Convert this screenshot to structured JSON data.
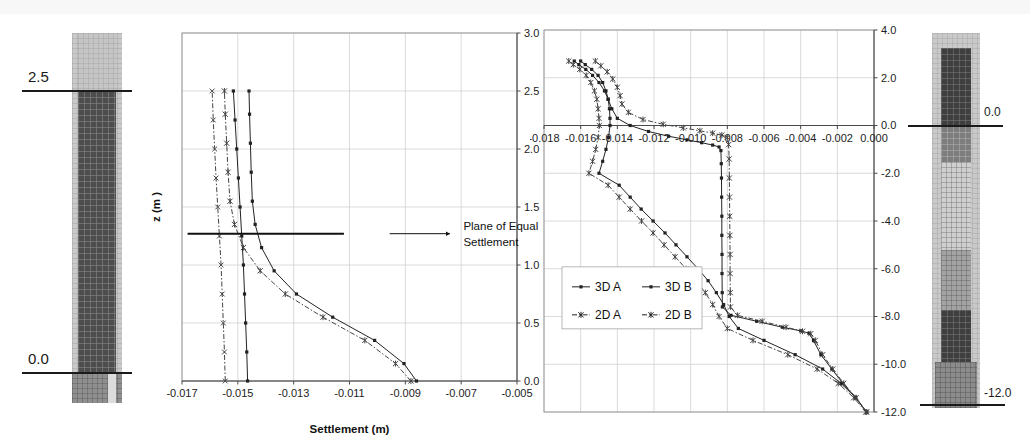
{
  "figure": {
    "background": "#ffffff",
    "width": 1030,
    "height": 443
  },
  "left_column_diagram": {
    "name": "soil-column-left",
    "top_label": "2.5",
    "bottom_label": "0.0",
    "outer_color": "#c9c9c9",
    "upper_fill_color": "#c2c2c2",
    "pile_color": "#4a4a4a",
    "base_color": "#8c8c8c"
  },
  "right_column_diagram": {
    "name": "soil-column-right",
    "top_label": "0.0",
    "bottom_label": "-12.0",
    "outer_color": "#c9c9c9",
    "pile_color": "#3f3f3f",
    "soil_color": "#9c9c9c",
    "light_band_color": "#cfcfcf"
  },
  "annotation": {
    "line1": "Plane of Equal",
    "line2": "Settlement"
  },
  "chart_data": [
    {
      "id": "left-chart",
      "type": "line",
      "title": "",
      "xlabel": "Settlement (m)",
      "ylabel": "z (m )",
      "xlim": [
        -0.017,
        -0.005
      ],
      "ylim": [
        0.0,
        3.0
      ],
      "xticks": [
        -0.017,
        -0.015,
        -0.013,
        -0.011,
        -0.009,
        -0.007,
        -0.005
      ],
      "xtick_labels": [
        "-0.017",
        "-0.015",
        "-0.013",
        "-0.011",
        "-0.009",
        "-0.007",
        "-0.005"
      ],
      "yticks": [
        0.0,
        0.5,
        1.0,
        1.5,
        2.0,
        2.5,
        3.0
      ],
      "ytick_labels": [
        "0.0",
        "0.5",
        "1.0",
        "1.5",
        "2.0",
        "2.5",
        "3.0"
      ],
      "grid": true,
      "legend": "none",
      "y_axis_side": "right",
      "annotation": {
        "text_line1": "Plane of Equal",
        "text_line2": "Settlement",
        "arrow_y": 1.27,
        "arrow_x_start": -0.0168,
        "arrow_x_end": -0.0112
      },
      "series": [
        {
          "name": "3D A",
          "marker": "dot",
          "dash": "solid",
          "color": "#222222",
          "points": [
            {
              "x": -0.01465,
              "y": 0.0
            },
            {
              "x": -0.01468,
              "y": 0.25
            },
            {
              "x": -0.01472,
              "y": 0.5
            },
            {
              "x": -0.01476,
              "y": 0.75
            },
            {
              "x": -0.0148,
              "y": 1.0
            },
            {
              "x": -0.01486,
              "y": 1.25
            },
            {
              "x": -0.01492,
              "y": 1.5
            },
            {
              "x": -0.01498,
              "y": 1.75
            },
            {
              "x": -0.01504,
              "y": 2.0
            },
            {
              "x": -0.0151,
              "y": 2.25
            },
            {
              "x": -0.01516,
              "y": 2.5
            }
          ]
        },
        {
          "name": "3D B",
          "marker": "dot",
          "dash": "solid",
          "color": "#222222",
          "points": [
            {
              "x": -0.0086,
              "y": 0.0
            },
            {
              "x": -0.00905,
              "y": 0.15
            },
            {
              "x": -0.0101,
              "y": 0.35
            },
            {
              "x": -0.0116,
              "y": 0.55
            },
            {
              "x": -0.0129,
              "y": 0.75
            },
            {
              "x": -0.0137,
              "y": 0.95
            },
            {
              "x": -0.01415,
              "y": 1.15
            },
            {
              "x": -0.01438,
              "y": 1.35
            },
            {
              "x": -0.01448,
              "y": 1.55
            },
            {
              "x": -0.01452,
              "y": 1.8
            },
            {
              "x": -0.01455,
              "y": 2.05
            },
            {
              "x": -0.01458,
              "y": 2.3
            },
            {
              "x": -0.0146,
              "y": 2.5
            }
          ]
        },
        {
          "name": "2D A",
          "marker": "cross",
          "dash": "dashdot",
          "color": "#444444",
          "points": [
            {
              "x": -0.01545,
              "y": 0.0
            },
            {
              "x": -0.01548,
              "y": 0.25
            },
            {
              "x": -0.01552,
              "y": 0.5
            },
            {
              "x": -0.01556,
              "y": 0.75
            },
            {
              "x": -0.0156,
              "y": 1.0
            },
            {
              "x": -0.01566,
              "y": 1.25
            },
            {
              "x": -0.01572,
              "y": 1.5
            },
            {
              "x": -0.01578,
              "y": 1.75
            },
            {
              "x": -0.01583,
              "y": 2.0
            },
            {
              "x": -0.01588,
              "y": 2.25
            },
            {
              "x": -0.01592,
              "y": 2.5
            }
          ]
        },
        {
          "name": "2D B",
          "marker": "star",
          "dash": "dashdot",
          "color": "#444444",
          "points": [
            {
              "x": -0.0088,
              "y": 0.0
            },
            {
              "x": -0.00935,
              "y": 0.15
            },
            {
              "x": -0.01045,
              "y": 0.35
            },
            {
              "x": -0.01195,
              "y": 0.55
            },
            {
              "x": -0.0133,
              "y": 0.75
            },
            {
              "x": -0.0142,
              "y": 0.95
            },
            {
              "x": -0.0148,
              "y": 1.15
            },
            {
              "x": -0.01512,
              "y": 1.35
            },
            {
              "x": -0.01528,
              "y": 1.55
            },
            {
              "x": -0.01535,
              "y": 1.8
            },
            {
              "x": -0.0154,
              "y": 2.05
            },
            {
              "x": -0.01545,
              "y": 2.3
            },
            {
              "x": -0.01548,
              "y": 2.5
            }
          ]
        }
      ]
    },
    {
      "id": "right-chart",
      "type": "line",
      "title": "",
      "xlabel": "Settlement (m)",
      "ylabel": "z (m )",
      "xlim": [
        -0.018,
        0.0
      ],
      "ylim": [
        -12.0,
        4.0
      ],
      "xticks": [
        -0.018,
        -0.016,
        -0.014,
        -0.012,
        -0.01,
        -0.008,
        -0.006,
        -0.004,
        -0.002,
        0.0
      ],
      "xtick_labels": [
        "-0.018",
        "-0.016",
        "-0.014",
        "-0.012",
        "-0.010",
        "-0.008",
        "-0.006",
        "-0.004",
        "-0.002",
        "0.000"
      ],
      "yticks": [
        -12.0,
        -10.0,
        -8.0,
        -6.0,
        -4.0,
        -2.0,
        0.0,
        2.0,
        4.0
      ],
      "ytick_labels": [
        "-12.0",
        "-10.0",
        "-8.0",
        "-6.0",
        "-4.0",
        "-2.0",
        "0.0",
        "2.0",
        "4.0"
      ],
      "grid": true,
      "legend": "inside-lower-left",
      "y_axis_side": "right",
      "legend_entries": [
        {
          "label": "3D A",
          "marker": "dot",
          "dash": "solid"
        },
        {
          "label": "3D B",
          "marker": "dot",
          "dash": "solid"
        },
        {
          "label": "2D A",
          "marker": "star",
          "dash": "dashdot"
        },
        {
          "label": "2D B",
          "marker": "star",
          "dash": "dashdot"
        }
      ],
      "series": [
        {
          "name": "3D A",
          "marker": "dot",
          "dash": "solid",
          "color": "#222222",
          "points": [
            {
              "x": -0.016,
              "y": 2.7
            },
            {
              "x": -0.01575,
              "y": 2.55
            },
            {
              "x": -0.0154,
              "y": 2.35
            },
            {
              "x": -0.01505,
              "y": 2.1
            },
            {
              "x": -0.0148,
              "y": 1.8
            },
            {
              "x": -0.01462,
              "y": 1.45
            },
            {
              "x": -0.0145,
              "y": 1.1
            },
            {
              "x": -0.01443,
              "y": 0.7
            },
            {
              "x": -0.0144,
              "y": 0.3
            },
            {
              "x": -0.0144,
              "y": 0.0
            },
            {
              "x": -0.01448,
              "y": -0.5
            },
            {
              "x": -0.01462,
              "y": -1.0
            },
            {
              "x": -0.0148,
              "y": -1.5
            },
            {
              "x": -0.015,
              "y": -2.0
            },
            {
              "x": -0.0139,
              "y": -2.5
            },
            {
              "x": -0.0133,
              "y": -3.0
            },
            {
              "x": -0.0127,
              "y": -3.5
            },
            {
              "x": -0.01205,
              "y": -4.0
            },
            {
              "x": -0.0114,
              "y": -4.5
            },
            {
              "x": -0.0108,
              "y": -5.0
            },
            {
              "x": -0.0102,
              "y": -5.5
            },
            {
              "x": -0.0096,
              "y": -6.0
            },
            {
              "x": -0.00905,
              "y": -6.5
            },
            {
              "x": -0.0086,
              "y": -7.0
            },
            {
              "x": -0.0082,
              "y": -7.5
            },
            {
              "x": -0.0079,
              "y": -8.0
            },
            {
              "x": -0.0074,
              "y": -8.5
            },
            {
              "x": -0.006,
              "y": -9.0
            },
            {
              "x": -0.0043,
              "y": -9.6
            },
            {
              "x": -0.0028,
              "y": -10.2
            },
            {
              "x": -0.0018,
              "y": -10.8
            },
            {
              "x": -0.001,
              "y": -11.4
            },
            {
              "x": -0.0004,
              "y": -12.0
            }
          ]
        },
        {
          "name": "3D B",
          "marker": "dot",
          "dash": "solid",
          "color": "#222222",
          "points": [
            {
              "x": -0.01635,
              "y": 2.7
            },
            {
              "x": -0.0161,
              "y": 2.55
            },
            {
              "x": -0.01572,
              "y": 2.35
            },
            {
              "x": -0.01535,
              "y": 2.1
            },
            {
              "x": -0.015,
              "y": 1.8
            },
            {
              "x": -0.0147,
              "y": 1.45
            },
            {
              "x": -0.0145,
              "y": 1.1
            },
            {
              "x": -0.0143,
              "y": 0.7
            },
            {
              "x": -0.014,
              "y": 0.3
            },
            {
              "x": -0.0133,
              "y": 0.0
            },
            {
              "x": -0.0123,
              "y": -0.25
            },
            {
              "x": -0.0112,
              "y": -0.45
            },
            {
              "x": -0.0102,
              "y": -0.6
            },
            {
              "x": -0.0094,
              "y": -0.72
            },
            {
              "x": -0.0088,
              "y": -0.82
            },
            {
              "x": -0.00845,
              "y": -0.9
            },
            {
              "x": -0.00835,
              "y": -1.05
            },
            {
              "x": -0.00833,
              "y": -1.6
            },
            {
              "x": -0.00832,
              "y": -2.2
            },
            {
              "x": -0.00831,
              "y": -3.0
            },
            {
              "x": -0.0083,
              "y": -3.8
            },
            {
              "x": -0.0083,
              "y": -4.6
            },
            {
              "x": -0.00829,
              "y": -5.4
            },
            {
              "x": -0.00829,
              "y": -6.2
            },
            {
              "x": -0.00828,
              "y": -7.0
            },
            {
              "x": -0.00827,
              "y": -7.6
            },
            {
              "x": -0.0078,
              "y": -7.95
            },
            {
              "x": -0.0064,
              "y": -8.2
            },
            {
              "x": -0.005,
              "y": -8.45
            },
            {
              "x": -0.004,
              "y": -8.6
            },
            {
              "x": -0.00355,
              "y": -8.7
            },
            {
              "x": -0.0033,
              "y": -9.0
            },
            {
              "x": -0.0029,
              "y": -9.6
            },
            {
              "x": -0.0023,
              "y": -10.2
            },
            {
              "x": -0.0017,
              "y": -10.8
            },
            {
              "x": -0.001,
              "y": -11.4
            },
            {
              "x": -0.0004,
              "y": -12.0
            }
          ]
        },
        {
          "name": "2D A",
          "marker": "star",
          "dash": "dashdot",
          "color": "#444444",
          "points": [
            {
              "x": -0.01665,
              "y": 2.7
            },
            {
              "x": -0.0164,
              "y": 2.55
            },
            {
              "x": -0.01605,
              "y": 2.35
            },
            {
              "x": -0.0157,
              "y": 2.1
            },
            {
              "x": -0.01545,
              "y": 1.8
            },
            {
              "x": -0.01525,
              "y": 1.45
            },
            {
              "x": -0.01512,
              "y": 1.1
            },
            {
              "x": -0.01505,
              "y": 0.7
            },
            {
              "x": -0.015,
              "y": 0.3
            },
            {
              "x": -0.01498,
              "y": 0.0
            },
            {
              "x": -0.01505,
              "y": -0.5
            },
            {
              "x": -0.01518,
              "y": -1.0
            },
            {
              "x": -0.01535,
              "y": -1.5
            },
            {
              "x": -0.01555,
              "y": -2.0
            },
            {
              "x": -0.0145,
              "y": -2.5
            },
            {
              "x": -0.0139,
              "y": -3.0
            },
            {
              "x": -0.0133,
              "y": -3.5
            },
            {
              "x": -0.01268,
              "y": -4.0
            },
            {
              "x": -0.01205,
              "y": -4.5
            },
            {
              "x": -0.01145,
              "y": -5.0
            },
            {
              "x": -0.01085,
              "y": -5.5
            },
            {
              "x": -0.01025,
              "y": -6.0
            },
            {
              "x": -0.0097,
              "y": -6.5
            },
            {
              "x": -0.0092,
              "y": -7.0
            },
            {
              "x": -0.0088,
              "y": -7.5
            },
            {
              "x": -0.00845,
              "y": -8.0
            },
            {
              "x": -0.008,
              "y": -8.5
            },
            {
              "x": -0.0066,
              "y": -9.0
            },
            {
              "x": -0.0047,
              "y": -9.6
            },
            {
              "x": -0.0031,
              "y": -10.2
            },
            {
              "x": -0.00195,
              "y": -10.8
            },
            {
              "x": -0.0011,
              "y": -11.4
            },
            {
              "x": -0.00045,
              "y": -12.0
            }
          ]
        },
        {
          "name": "2D B",
          "marker": "star",
          "dash": "dashdot",
          "color": "#444444",
          "points": [
            {
              "x": -0.0152,
              "y": 2.7
            },
            {
              "x": -0.0149,
              "y": 2.5
            },
            {
              "x": -0.01455,
              "y": 2.25
            },
            {
              "x": -0.01425,
              "y": 1.95
            },
            {
              "x": -0.014,
              "y": 1.6
            },
            {
              "x": -0.01385,
              "y": 1.25
            },
            {
              "x": -0.01375,
              "y": 0.9
            },
            {
              "x": -0.0134,
              "y": 0.55
            },
            {
              "x": -0.0126,
              "y": 0.25
            },
            {
              "x": -0.0115,
              "y": 0.05
            },
            {
              "x": -0.0104,
              "y": -0.1
            },
            {
              "x": -0.0095,
              "y": -0.22
            },
            {
              "x": -0.0088,
              "y": -0.32
            },
            {
              "x": -0.0083,
              "y": -0.4
            },
            {
              "x": -0.008,
              "y": -0.5
            },
            {
              "x": -0.00793,
              "y": -0.8
            },
            {
              "x": -0.0079,
              "y": -1.4
            },
            {
              "x": -0.00789,
              "y": -2.2
            },
            {
              "x": -0.00788,
              "y": -3.0
            },
            {
              "x": -0.00787,
              "y": -3.8
            },
            {
              "x": -0.00786,
              "y": -4.6
            },
            {
              "x": -0.00785,
              "y": -5.4
            },
            {
              "x": -0.00785,
              "y": -6.2
            },
            {
              "x": -0.00784,
              "y": -7.0
            },
            {
              "x": -0.00783,
              "y": -7.6
            },
            {
              "x": -0.00745,
              "y": -7.95
            },
            {
              "x": -0.0061,
              "y": -8.2
            },
            {
              "x": -0.0048,
              "y": -8.45
            },
            {
              "x": -0.0039,
              "y": -8.62
            },
            {
              "x": -0.00345,
              "y": -8.72
            },
            {
              "x": -0.0032,
              "y": -9.0
            },
            {
              "x": -0.0028,
              "y": -9.6
            },
            {
              "x": -0.00225,
              "y": -10.2
            },
            {
              "x": -0.00165,
              "y": -10.8
            },
            {
              "x": -0.00098,
              "y": -11.4
            },
            {
              "x": -0.0004,
              "y": -12.0
            }
          ]
        }
      ]
    }
  ]
}
